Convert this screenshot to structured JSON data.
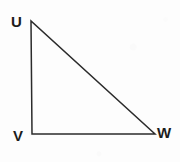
{
  "figure": {
    "kind": "geometry-diagram",
    "shape_name": "right-triangle",
    "canvas": {
      "width": 180,
      "height": 162
    },
    "background_color": "#fdfdfd",
    "stroke_color": "#2b2b2b",
    "stroke_width": 1.5,
    "label_color": "#1c1c1c",
    "label_font_size": 15
  },
  "vertices": [
    {
      "name": "U",
      "label": "U",
      "x": 31,
      "y": 21,
      "label_x": 11,
      "label_y": 14,
      "position": "top-left"
    },
    {
      "name": "V",
      "label": "V",
      "x": 32,
      "y": 134,
      "label_x": 13,
      "label_y": 128,
      "position": "bottom-left"
    },
    {
      "name": "W",
      "label": "W",
      "x": 155,
      "y": 134,
      "label_x": 157,
      "label_y": 125,
      "position": "bottom-right"
    }
  ],
  "edges": [
    {
      "name": "UV",
      "from": "U",
      "to": "V",
      "orientation": "vertical",
      "kind": "leg"
    },
    {
      "name": "VW",
      "from": "V",
      "to": "W",
      "orientation": "horizontal",
      "kind": "leg"
    },
    {
      "name": "WU",
      "from": "W",
      "to": "U",
      "orientation": "diagonal",
      "kind": "hypotenuse"
    }
  ],
  "right_angle_at": "V",
  "labels": {
    "u": "U",
    "v": "V",
    "w": "W"
  }
}
